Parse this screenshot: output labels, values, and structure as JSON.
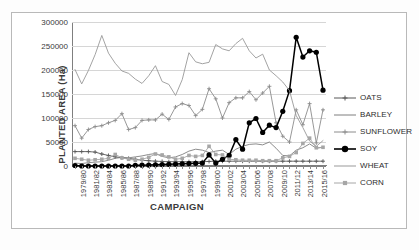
{
  "chart_data": {
    "type": "line",
    "title": "",
    "xlabel": "CAMPAIGN",
    "ylabel": "PLANTED AREA (Ha)",
    "ylim": [
      0,
      300000
    ],
    "ytick_values": [
      0,
      50000,
      100000,
      150000,
      200000,
      250000,
      300000
    ],
    "ytick_labels": [
      "0",
      "50000",
      "100000",
      "150000",
      "200000",
      "250000",
      "300000"
    ],
    "grid": true,
    "legend_position": "right",
    "categories": [
      "1979/80",
      "1980/81",
      "1981/82",
      "1982/83",
      "1983/84",
      "1984/85",
      "1985/86",
      "1986/87",
      "1987/88",
      "1988/89",
      "1989/90",
      "1990/91",
      "1991/92",
      "1992/93",
      "1993/94",
      "1994/95",
      "1995/96",
      "1996/97",
      "1997/98",
      "1998/99",
      "1999/00",
      "2000/01",
      "2001/02",
      "2002/03",
      "2003/04",
      "2004/05",
      "2005/06",
      "2006/07",
      "2007/08",
      "2008/09",
      "2009/10",
      "2010/11",
      "2011/12",
      "2012/13",
      "2013/14",
      "2014/15",
      "2015/16",
      "2016/17"
    ],
    "xtick_labels_shown": [
      "1979/80",
      "1981/82",
      "1983/84",
      "1985/86",
      "1987/88",
      "1989/90",
      "1991/92",
      "1993/94",
      "1995/96",
      "1997/98",
      "1999/00",
      "2001/02",
      "2003/04",
      "2005/06",
      "2007/08",
      "2009/10",
      "2011/12",
      "2013/14",
      "2015/16"
    ],
    "series": [
      {
        "name": "OATS",
        "color": "#595959",
        "marker": "cross",
        "values": [
          30000,
          30000,
          30000,
          29000,
          25000,
          22000,
          19000,
          17000,
          16000,
          14000,
          12000,
          11000,
          10000,
          9500,
          9000,
          9000,
          9000,
          9000,
          9000,
          9000,
          9500,
          10000,
          10000,
          10000,
          10000,
          10000,
          10000,
          10000,
          10000,
          10000,
          10000,
          10000,
          10000,
          10000,
          10000,
          10000,
          10000,
          10000
        ]
      },
      {
        "name": "BARLEY",
        "color": "#7f7f7f",
        "marker": "none",
        "values": [
          6000,
          5000,
          7000,
          8000,
          9000,
          12000,
          16000,
          18000,
          17000,
          19000,
          21000,
          24000,
          26000,
          20000,
          17000,
          19000,
          24000,
          31000,
          35000,
          33000,
          28000,
          31000,
          33000,
          24000,
          35000,
          41000,
          45000,
          46000,
          44000,
          50000,
          37000,
          22000,
          21000,
          33000,
          38000,
          46000,
          37000,
          39000
        ]
      },
      {
        "name": "SUNFLOWER",
        "color": "#8c8c8c",
        "marker": "cross",
        "values": [
          84000,
          58000,
          76000,
          82000,
          84000,
          90000,
          95000,
          109000,
          76000,
          80000,
          95000,
          96000,
          96000,
          108000,
          97000,
          123000,
          130000,
          126000,
          105000,
          118000,
          161000,
          140000,
          100000,
          132000,
          142000,
          142000,
          155000,
          138000,
          152000,
          166000,
          90000,
          62000,
          50000,
          117000,
          86000,
          130000,
          48000,
          117000
        ]
      },
      {
        "name": "SOY",
        "color": "#000000",
        "marker": "circle",
        "values": [
          1000,
          0,
          0,
          0,
          0,
          0,
          0,
          0,
          0,
          1500,
          1800,
          2000,
          2500,
          3000,
          3500,
          4000,
          4500,
          5000,
          5500,
          6000,
          23000,
          6000,
          14000,
          22000,
          55000,
          35000,
          90000,
          99000,
          70000,
          85000,
          80000,
          114000,
          157000,
          268000,
          227000,
          240000,
          237000,
          158000
        ]
      },
      {
        "name": "WHEAT",
        "color": "#999999",
        "marker": "none",
        "values": [
          201000,
          171000,
          199000,
          232000,
          272000,
          235000,
          214000,
          198000,
          193000,
          181000,
          172000,
          188000,
          209000,
          176000,
          170000,
          147000,
          180000,
          236000,
          217000,
          213000,
          216000,
          253000,
          244000,
          240000,
          255000,
          266000,
          240000,
          225000,
          233000,
          200000,
          188000,
          175000,
          157000,
          105000,
          80000,
          52000,
          41000,
          53000
        ]
      },
      {
        "name": "CORN",
        "color": "#a6a6a6",
        "marker": "square",
        "values": [
          16000,
          14000,
          12000,
          13000,
          14000,
          16000,
          24000,
          17000,
          14000,
          12000,
          14000,
          18000,
          25000,
          23000,
          19000,
          14000,
          16000,
          22000,
          20000,
          22000,
          41000,
          24000,
          23000,
          14000,
          13000,
          12000,
          12000,
          12000,
          11000,
          11000,
          11000,
          17000,
          20000,
          28000,
          47000,
          58000,
          38000,
          39000
        ]
      }
    ]
  },
  "legend": {
    "items": [
      {
        "label": "OATS"
      },
      {
        "label": "BARLEY"
      },
      {
        "label": "SUNFLOWER"
      },
      {
        "label": "SOY"
      },
      {
        "label": "WHEAT"
      },
      {
        "label": "CORN"
      }
    ]
  }
}
